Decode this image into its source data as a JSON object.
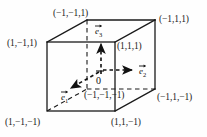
{
  "figure": {
    "colors": {
      "line": "#1a1a1a",
      "text": "#1a1a1a",
      "background": "#fefefe"
    }
  },
  "origin": {
    "label": "0"
  },
  "vertices": [
    {
      "id": "top-back-left",
      "label": "(−1,−1,1)"
    },
    {
      "id": "top-back-right",
      "label": "(−1,1,1)"
    },
    {
      "id": "top-front-left",
      "label": "(1,−1,1)"
    },
    {
      "id": "top-front-right",
      "label": "(1,1,1)"
    },
    {
      "id": "bottom-back-left",
      "label": "(−1,−1,−1)"
    },
    {
      "id": "bottom-back-right",
      "label": "(−1,1,−1)"
    },
    {
      "id": "bottom-front-left",
      "label": "(1,−1,−1)"
    },
    {
      "id": "bottom-front-right",
      "label": "(1,1,−1)"
    }
  ],
  "basis_vectors": [
    {
      "id": "e1",
      "symbol": "e",
      "subscript": "1",
      "direction": "down-left",
      "style": "dashed-arrow"
    },
    {
      "id": "e2",
      "symbol": "e",
      "subscript": "2",
      "direction": "right",
      "style": "dashed-arrow"
    },
    {
      "id": "e3",
      "symbol": "e",
      "subscript": "3",
      "direction": "up",
      "style": "dashed-arrow"
    }
  ],
  "geometry": {
    "front_face": {
      "left": 47,
      "right": 115,
      "top": 42,
      "bottom": 111
    },
    "back_face": {
      "left": 87,
      "right": 155,
      "top": 20,
      "bottom": 89
    },
    "origin_point": {
      "x": 101,
      "y": 76
    }
  }
}
